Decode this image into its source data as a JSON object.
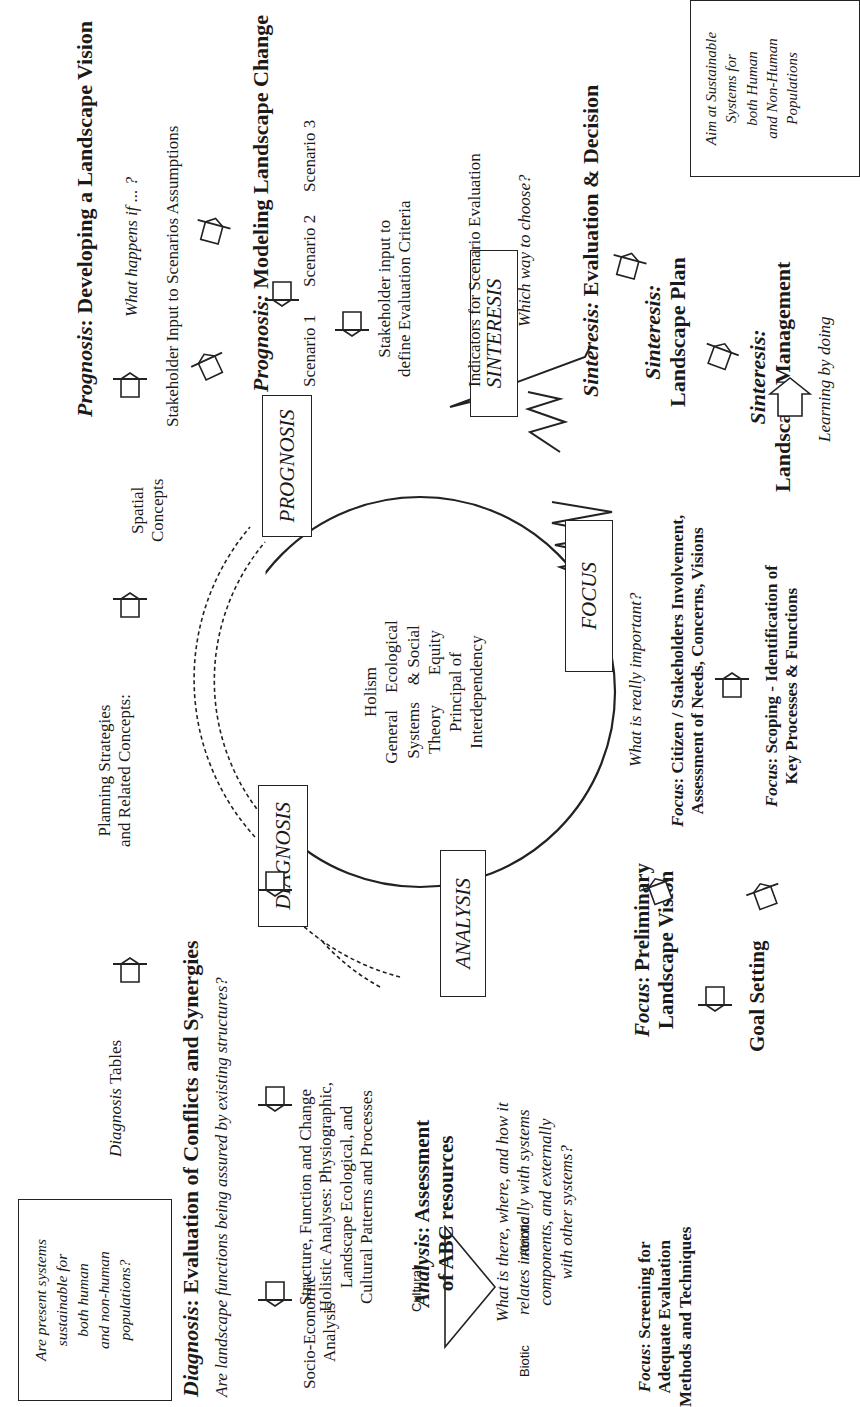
{
  "cycle": {
    "center_lines": [
      "Holism",
      "General    Ecological",
      "Systems    & Social",
      "Theory       Equity",
      "Principal of",
      "Interdependency"
    ],
    "phases": {
      "diagnosis": "DIAGNOSIS",
      "prognosis": "PROGNOSIS",
      "sinteresis": "SINTERESIS",
      "focus": "FOCUS",
      "analysis": "ANALYSIS"
    }
  },
  "boxes": {
    "present_systems": [
      "Are present systems",
      "sustainable for",
      "both human",
      "and non-human",
      "populations?"
    ],
    "aim_sustainable": [
      "Aim at Sustainable",
      "Systems for",
      "both Human",
      "and Non-Human",
      "Populations"
    ]
  },
  "diagnosis": {
    "heading_prefix": "Diagnosis",
    "heading_rest": ":  Evaluation of Conflicts and Synergies",
    "question": "Are landscape functions being assured by existing structures?",
    "tables_prefix": "Diagnosis",
    "tables_rest": " Tables",
    "planning": [
      "Planning Strategies",
      "and Related Concepts:"
    ],
    "spatial": [
      "Spatial",
      "Concepts"
    ]
  },
  "prognosis": {
    "vision_prefix": "Prognosis",
    "vision_rest": ":  Developing a Landscape Vision",
    "what_happens": "What happens if ... ?",
    "stakeholder_input": "Stakeholder Input to Scenarios Assumptions",
    "modeling_prefix": "Prognosis:",
    "modeling_rest": " Modeling Landscape Change",
    "scenarios": [
      "Scenario 1",
      "Scenario 2",
      "Scenario 3"
    ],
    "stakeholder_criteria": [
      "Stakeholder input to",
      "define Evaluation Criteria"
    ],
    "indicators": "Indicators for Scenario Evaluation",
    "which_way": "Which way to choose?"
  },
  "sinteresis": {
    "eval_prefix": "Sinteresis:",
    "eval_rest": "  Evaluation & Decision",
    "plan_label": "Sinteresis:",
    "plan_title": "Landscape Plan",
    "mgmt_label": "Sinteresis:",
    "mgmt_title": "Landscape Management",
    "learning": "Learning by doing"
  },
  "analysis": {
    "socio": [
      "Socio-Economic",
      "Analysis"
    ],
    "holistic": [
      "Structure, Function and Change",
      "Holistic Analyses: Physiographic,",
      "Landscape Ecological, and",
      "Cultural Patterns and Processes"
    ],
    "heading_prefix": "Analysis",
    "heading_rest": ":  Assessment",
    "heading_line2": "of ABC resources",
    "question": [
      "What is there, where, and how it",
      "relates internally with systems",
      "components, and externally",
      "with other systems?"
    ],
    "triangle": {
      "top": "Cultural",
      "left": "Biotic",
      "right": "Abiotic"
    }
  },
  "focus": {
    "important": "What is really important?",
    "citizen_prefix": "Focus",
    "citizen_rest": ": Citizen / Stakeholders Involvement,",
    "citizen_line2": "Assessment of Needs, Concerns, Visions",
    "scoping_prefix": "Focus",
    "scoping_rest": ": Scoping - Identification of",
    "scoping_line2": "Key Processes & Functions",
    "preliminary_prefix": "Focus",
    "preliminary_rest": ":  Preliminary",
    "preliminary_line2": "Landscape Vision",
    "goal": "Goal Setting",
    "screening_prefix": "Focus",
    "screening_rest": ": Screening for",
    "screening_line2": "Adequate Evaluation",
    "screening_line3": "Methods and Techniques"
  }
}
